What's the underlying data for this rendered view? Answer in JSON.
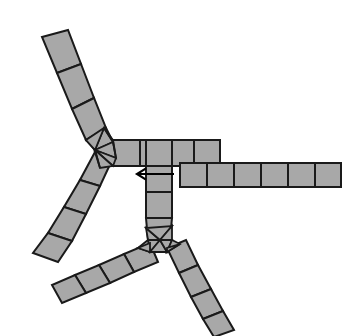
{
  "figure": {
    "caption": "",
    "width": 361,
    "height": 336,
    "background_color": "#ffffff"
  },
  "style": {
    "quad_fill": "#a8a8a8",
    "quad_stroke": "#1a1a1a",
    "quad_stroke_width": 2.0,
    "tri_fill": "#a8a8a8",
    "tri_stroke": "#1a1a1a",
    "tri_stroke_width": 1.8,
    "arrow_color": "#000000",
    "arrow_stroke_width": 2.2
  },
  "annotations": [
    {
      "name": "direction-arrow",
      "icon": "arrow-left-icon",
      "label": "",
      "direction": "left",
      "tail_x": 174,
      "tail_y": 174,
      "tip_x": 137,
      "tip_y": 174,
      "head_size": 9
    }
  ],
  "chart_data": {
    "type": "diagram",
    "hub_count": 2,
    "branch_count": 6,
    "hubs": [
      {
        "name": "upper-hub",
        "center_x": 104,
        "center_y": 146,
        "valence": 3
      },
      {
        "name": "lower-hub",
        "center_x": 160,
        "center_y": 240,
        "valence": 3
      }
    ],
    "branches": [
      {
        "name": "branch-upper-left",
        "hub": "upper-hub",
        "segments": 5,
        "direction": "up-left"
      },
      {
        "name": "branch-lower-left",
        "hub": "upper-hub",
        "segments": 5,
        "direction": "down-left"
      },
      {
        "name": "branch-upper-right-horizontal",
        "hub": "upper-hub",
        "segments": 5,
        "direction": "right"
      },
      {
        "name": "branch-vertical-connector",
        "hub": "upper-hub",
        "segments": 4,
        "direction": "down"
      },
      {
        "name": "branch-long-right-horizontal",
        "hub": "lower-hub",
        "segments": 6,
        "direction": "right"
      },
      {
        "name": "branch-bottom-left",
        "hub": "lower-hub",
        "segments": 5,
        "direction": "down-left"
      },
      {
        "name": "branch-bottom-right",
        "hub": "lower-hub",
        "segments": 5,
        "direction": "down-right"
      }
    ]
  },
  "mesh": {
    "strips": [
      {
        "name": "branch-upper-left",
        "segments": [
          [
            [
              42,
              37
            ],
            [
              68,
              30
            ],
            [
              81,
              64
            ],
            [
              57,
              73
            ]
          ],
          [
            [
              57,
              73
            ],
            [
              81,
              64
            ],
            [
              94,
              98
            ],
            [
              72,
              109
            ]
          ],
          [
            [
              72,
              109
            ],
            [
              94,
              98
            ],
            [
              106,
              128
            ],
            [
              86,
              140
            ]
          ],
          [
            [
              86,
              140
            ],
            [
              106,
              128
            ],
            [
              113,
              142
            ],
            [
              95,
              150
            ]
          ]
        ]
      },
      {
        "name": "branch-lower-left",
        "segments": [
          [
            [
              95,
              152
            ],
            [
              113,
              158
            ],
            [
              100,
              186
            ],
            [
              80,
              180
            ]
          ],
          [
            [
              80,
              180
            ],
            [
              100,
              186
            ],
            [
              86,
              214
            ],
            [
              64,
              207
            ]
          ],
          [
            [
              64,
              207
            ],
            [
              86,
              214
            ],
            [
              72,
              241
            ],
            [
              48,
              233
            ]
          ],
          [
            [
              48,
              233
            ],
            [
              72,
              241
            ],
            [
              58,
              262
            ],
            [
              33,
              253
            ]
          ]
        ]
      },
      {
        "name": "branch-upper-right-horizontal",
        "segments": [
          [
            [
              113,
              140
            ],
            [
              140,
              140
            ],
            [
              140,
              166
            ],
            [
              113,
              166
            ]
          ],
          [
            [
              140,
              140
            ],
            [
              167,
              140
            ],
            [
              167,
              166
            ],
            [
              140,
              166
            ]
          ],
          [
            [
              167,
              140
            ],
            [
              194,
              140
            ],
            [
              194,
              166
            ],
            [
              167,
              166
            ]
          ],
          [
            [
              194,
              140
            ],
            [
              220,
              140
            ],
            [
              220,
              166
            ],
            [
              194,
              166
            ]
          ]
        ]
      },
      {
        "name": "branch-vertical-connector",
        "segments": [
          [
            [
              146,
              140
            ],
            [
              172,
              140
            ],
            [
              172,
              166
            ],
            [
              146,
              166
            ]
          ],
          [
            [
              146,
              166
            ],
            [
              172,
              166
            ],
            [
              172,
              192
            ],
            [
              146,
              192
            ]
          ],
          [
            [
              146,
              192
            ],
            [
              172,
              192
            ],
            [
              172,
              218
            ],
            [
              146,
              218
            ]
          ],
          [
            [
              146,
              218
            ],
            [
              172,
              218
            ],
            [
              170,
              240
            ],
            [
              148,
              240
            ]
          ]
        ]
      },
      {
        "name": "branch-long-right-horizontal",
        "segments": [
          [
            [
              180,
              163
            ],
            [
              207,
              163
            ],
            [
              207,
              187
            ],
            [
              180,
              187
            ]
          ],
          [
            [
              207,
              163
            ],
            [
              234,
              163
            ],
            [
              234,
              187
            ],
            [
              207,
              187
            ]
          ],
          [
            [
              234,
              163
            ],
            [
              261,
              163
            ],
            [
              261,
              187
            ],
            [
              234,
              187
            ]
          ],
          [
            [
              261,
              163
            ],
            [
              288,
              163
            ],
            [
              288,
              187
            ],
            [
              261,
              187
            ]
          ],
          [
            [
              288,
              163
            ],
            [
              315,
              163
            ],
            [
              315,
              187
            ],
            [
              288,
              187
            ]
          ],
          [
            [
              315,
              163
            ],
            [
              341,
              163
            ],
            [
              341,
              187
            ],
            [
              315,
              187
            ]
          ]
        ]
      },
      {
        "name": "branch-bottom-left",
        "segments": [
          [
            [
              150,
              243
            ],
            [
              158,
              262
            ],
            [
              134,
              272
            ],
            [
              124,
              254
            ]
          ],
          [
            [
              124,
              254
            ],
            [
              134,
              272
            ],
            [
              110,
              283
            ],
            [
              99,
              265
            ]
          ],
          [
            [
              99,
              265
            ],
            [
              110,
              283
            ],
            [
              86,
              293
            ],
            [
              75,
              275
            ]
          ],
          [
            [
              75,
              275
            ],
            [
              86,
              293
            ],
            [
              62,
              303
            ],
            [
              52,
              285
            ]
          ]
        ]
      },
      {
        "name": "branch-bottom-right",
        "segments": [
          [
            [
              167,
              248
            ],
            [
              186,
              240
            ],
            [
              198,
              265
            ],
            [
              179,
              273
            ]
          ],
          [
            [
              179,
              273
            ],
            [
              198,
              265
            ],
            [
              211,
              289
            ],
            [
              191,
              297
            ]
          ],
          [
            [
              191,
              297
            ],
            [
              211,
              289
            ],
            [
              223,
              311
            ],
            [
              203,
              319
            ]
          ],
          [
            [
              203,
              319
            ],
            [
              223,
              311
            ],
            [
              234,
              330
            ],
            [
              214,
              337
            ]
          ]
        ]
      }
    ],
    "hubs": [
      {
        "name": "upper-hub",
        "triangles": [
          [
            [
              95,
              150
            ],
            [
              113,
              142
            ],
            [
              104,
              128
            ]
          ],
          [
            [
              95,
              150
            ],
            [
              104,
              128
            ],
            [
              86,
              140
            ]
          ],
          [
            [
              95,
              150
            ],
            [
              113,
              142
            ],
            [
              116,
              158
            ]
          ],
          [
            [
              95,
              150
            ],
            [
              116,
              158
            ],
            [
              113,
              166
            ]
          ],
          [
            [
              95,
              150
            ],
            [
              113,
              166
            ],
            [
              100,
              168
            ]
          ],
          [
            [
              95,
              150
            ],
            [
              100,
              168
            ],
            [
              95,
              152
            ]
          ],
          [
            [
              113,
              142
            ],
            [
              116,
              158
            ],
            [
              113,
              140
            ]
          ],
          [
            [
              104,
              128
            ],
            [
              113,
              142
            ],
            [
              113,
              140
            ]
          ]
        ]
      },
      {
        "name": "lower-hub",
        "triangles": [
          [
            [
              160,
              240
            ],
            [
              148,
              240
            ],
            [
              146,
              228
            ]
          ],
          [
            [
              160,
              240
            ],
            [
              146,
              228
            ],
            [
              172,
              226
            ]
          ],
          [
            [
              160,
              240
            ],
            [
              172,
              226
            ],
            [
              172,
              240
            ]
          ],
          [
            [
              160,
              240
            ],
            [
              148,
              240
            ],
            [
              150,
              252
            ]
          ],
          [
            [
              160,
              240
            ],
            [
              150,
              252
            ],
            [
              167,
              252
            ]
          ],
          [
            [
              160,
              240
            ],
            [
              167,
              252
            ],
            [
              172,
              240
            ]
          ],
          [
            [
              148,
              240
            ],
            [
              150,
              252
            ],
            [
              138,
              248
            ]
          ],
          [
            [
              138,
              248
            ],
            [
              150,
              252
            ],
            [
              150,
              243
            ]
          ],
          [
            [
              167,
              252
            ],
            [
              172,
              240
            ],
            [
              180,
              244
            ]
          ],
          [
            [
              167,
              252
            ],
            [
              180,
              244
            ],
            [
              167,
              248
            ]
          ]
        ]
      }
    ]
  }
}
